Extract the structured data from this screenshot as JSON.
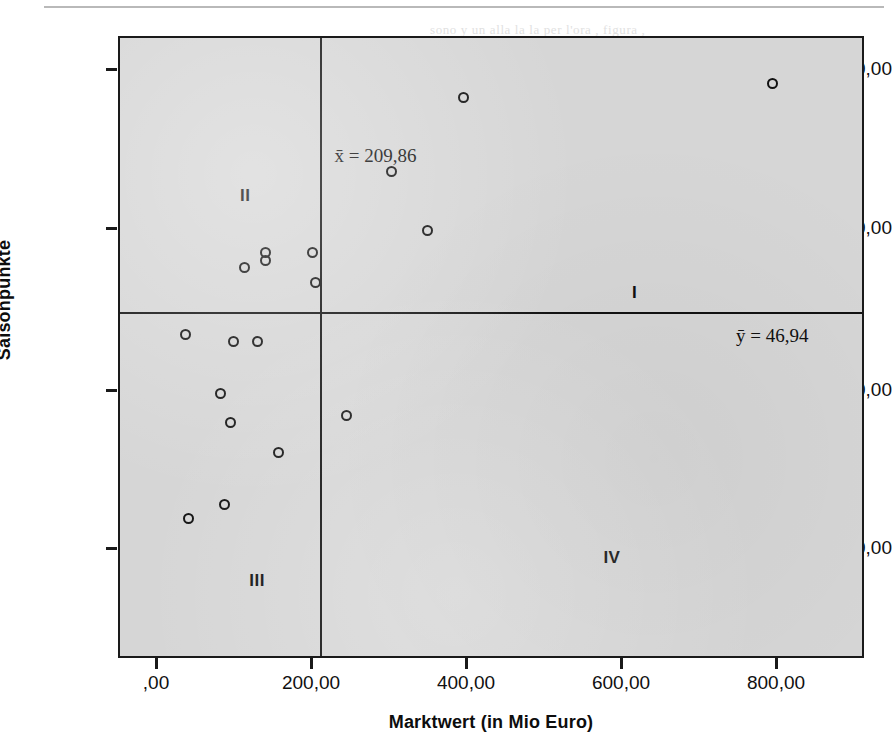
{
  "chart_data": {
    "type": "scatter",
    "title": "",
    "xlabel": "Marktwert (in Mio Euro)",
    "ylabel": "Saisonpunkte",
    "xlim": [
      -49,
      914
    ],
    "ylim": [
      -0.1,
      84.1
    ],
    "grid": false,
    "legend": null,
    "xticks": [
      0,
      200,
      400,
      600,
      800
    ],
    "xtick_labels": [
      ",00",
      "200,00",
      "400,00",
      "600,00",
      "800,00"
    ],
    "yticks": [
      20,
      40,
      60,
      80
    ],
    "ytick_labels": [
      "20,00",
      "40,00",
      "60,00",
      "80,00"
    ],
    "points": [
      {
        "x": 793,
        "y": 78
      },
      {
        "x": 395,
        "y": 76
      },
      {
        "x": 302,
        "y": 66
      },
      {
        "x": 348,
        "y": 58
      },
      {
        "x": 200,
        "y": 55
      },
      {
        "x": 139,
        "y": 55
      },
      {
        "x": 139,
        "y": 54
      },
      {
        "x": 112,
        "y": 53
      },
      {
        "x": 204,
        "y": 51
      },
      {
        "x": 36,
        "y": 44
      },
      {
        "x": 97,
        "y": 43
      },
      {
        "x": 128,
        "y": 43
      },
      {
        "x": 81,
        "y": 36
      },
      {
        "x": 244,
        "y": 33
      },
      {
        "x": 94,
        "y": 32
      },
      {
        "x": 156,
        "y": 28
      },
      {
        "x": 86,
        "y": 21
      },
      {
        "x": 39,
        "y": 19
      }
    ],
    "reference_lines": [
      {
        "orientation": "vertical",
        "value": 209.86,
        "label": "x̄ = 209,86"
      },
      {
        "orientation": "horizontal",
        "value": 46.94,
        "label": "ȳ = 46,94"
      }
    ],
    "annotations": [
      {
        "text": "I",
        "x": 612,
        "y": 51
      },
      {
        "text": "II",
        "x": 106,
        "y": 64
      },
      {
        "text": "III",
        "x": 118,
        "y": 12
      },
      {
        "text": "IV",
        "x": 575,
        "y": 15
      }
    ]
  },
  "axes": {
    "y_title": "Saisonpunkte",
    "x_title": "Marktwert (in Mio Euro)",
    "y_tick_labels": [
      "80,00",
      "60,00",
      "40,00",
      "20,00"
    ],
    "x_tick_labels": [
      ",00",
      "200,00",
      "400,00",
      "600,00",
      "800,00"
    ]
  },
  "mean_lines": {
    "x_mean_label": "x̄ = 209,86",
    "y_mean_label": "ȳ = 46,94",
    "x_mean_value": 209.86,
    "y_mean_value": 46.94
  },
  "quadrants": {
    "one": "I",
    "two": "II",
    "three": "III",
    "four": "IV"
  },
  "colors": {
    "panel_background": "#d6d6d6",
    "frame": "#1a1a1a",
    "point_stroke": "#111111",
    "text": "#101010",
    "page_background": "#ffffff"
  },
  "bleed_through": [
    {
      "text": "sono y un alla la la  per  l'ora  ,  figura  ,",
      "x": 430,
      "y": 22
    },
    {
      "text": "la para , e tumere  sulla la uno il  , u  agli o",
      "x": 420,
      "y": 48
    },
    {
      "text": "di  la  di  la  figura  e  i  la  cambio",
      "x": 440,
      "y": 74
    },
    {
      "text": "de  la  di  era  u  la  in  la  propria  sulla",
      "x": 450,
      "y": 100
    },
    {
      "text": "la  la  figura  di  per  la  i  ,  la  l  ,  la  ,  di",
      "x": 430,
      "y": 126
    },
    {
      "text": "sulla  la  ,  l  ora  per  si  la  de  ,  la  ,  ne",
      "x": 440,
      "y": 152
    },
    {
      "text": "il  e  la  ,  la  un  ,  de  la  i  l  ora  con",
      "x": 430,
      "y": 178
    },
    {
      "text": "la di una, con la sua i mandato la ,",
      "x": 420,
      "y": 348
    },
    {
      "text": "la  norma",
      "x": 425,
      "y": 374
    },
    {
      "text": "alla  di  ,  la  , e  la  , e  la",
      "x": 430,
      "y": 428
    },
    {
      "text": "la  di  ,  la  ,  l  i  ,  la  per",
      "x": 425,
      "y": 460
    },
    {
      "text": "sulla  la  di  normale  ,  la  i  ,  alla  i  ,  la  ,  la",
      "x": 415,
      "y": 522
    },
    {
      "text": "la  ,  l  ,  norma  sulla  ,  la",
      "x": 425,
      "y": 548
    },
    {
      "text": "la  ,  l  i  ,  la  , e  l  ,  la  , e  le  ,  di  la",
      "x": 420,
      "y": 580
    },
    {
      "text": "e  ,  la  ,  in  ,  normale  ,  la  ,  i  la  ,  di",
      "x": 425,
      "y": 606
    }
  ]
}
